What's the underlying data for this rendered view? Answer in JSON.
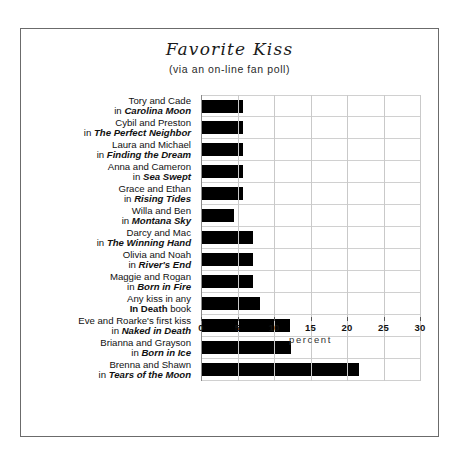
{
  "chart_data": {
    "type": "bar",
    "orientation": "horizontal",
    "title": "Favorite Kiss",
    "subtitle": "(via an on-line fan poll)",
    "xlabel": "percent",
    "ylabel": "",
    "xlim": [
      0,
      30
    ],
    "xticks": [
      0,
      5,
      10,
      15,
      20,
      25,
      30
    ],
    "xtick_labels": [
      "0",
      "5",
      "10",
      "15",
      "20",
      "25",
      "30"
    ],
    "grid": true,
    "legend": false,
    "bar_color": "#000000",
    "categories": [
      {
        "names": "Tory and Cade",
        "in_word": "in",
        "book": "Carolina Moon",
        "book_style": "bold-italic",
        "suffix": ""
      },
      {
        "names": "Cybil and Preston",
        "in_word": "in",
        "book": "The Perfect Neighbor",
        "book_style": "bold-italic",
        "suffix": ""
      },
      {
        "names": "Laura and Michael",
        "in_word": "in",
        "book": "Finding the Dream",
        "book_style": "bold-italic",
        "suffix": ""
      },
      {
        "names": "Anna and Cameron",
        "in_word": "in",
        "book": "Sea Swept",
        "book_style": "bold-italic",
        "suffix": ""
      },
      {
        "names": "Grace and Ethan",
        "in_word": "in",
        "book": "Rising Tides",
        "book_style": "bold-italic",
        "suffix": ""
      },
      {
        "names": "Willa and Ben",
        "in_word": "in",
        "book": "Montana Sky",
        "book_style": "bold-italic",
        "suffix": ""
      },
      {
        "names": "Darcy and Mac",
        "in_word": "in",
        "book": "The Winning Hand",
        "book_style": "bold-italic",
        "suffix": ""
      },
      {
        "names": "Olivia and Noah",
        "in_word": "in",
        "book": "River's End",
        "book_style": "bold-italic",
        "suffix": ""
      },
      {
        "names": "Maggie and Rogan",
        "in_word": "in",
        "book": "Born in Fire",
        "book_style": "bold-italic",
        "suffix": ""
      },
      {
        "names": "Any kiss in any",
        "in_word": "",
        "book": "In Death",
        "book_style": "bold",
        "suffix": " book"
      },
      {
        "names": "Eve and Roarke's first kiss",
        "in_word": "in",
        "book": "Naked in Death",
        "book_style": "bold-italic",
        "suffix": ""
      },
      {
        "names": "Brianna and Grayson",
        "in_word": "in",
        "book": "Born in Ice",
        "book_style": "bold-italic",
        "suffix": ""
      },
      {
        "names": "Brenna and Shawn",
        "in_word": "in",
        "book": "Tears of the Moon",
        "book_style": "bold-italic",
        "suffix": ""
      }
    ],
    "values": [
      5.6,
      5.6,
      5.6,
      5.6,
      5.6,
      4.4,
      7.0,
      7.0,
      7.0,
      8.0,
      12.0,
      12.2,
      21.5
    ]
  }
}
